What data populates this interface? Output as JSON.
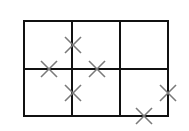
{
  "diagram": {
    "type": "grid-with-markers",
    "colors": {
      "background": "#ffffff",
      "grid": "#111111",
      "marker": "#7a7a7a"
    },
    "grid": {
      "rows": 2,
      "cols": 3,
      "x_lines": [
        24,
        72,
        120,
        168
      ],
      "y_lines": [
        21,
        69,
        116
      ],
      "stroke_width": 2
    },
    "markers": [
      {
        "shape": "x",
        "cx": 73,
        "cy": 45,
        "position": "on vertical line between row1 col1 and col2"
      },
      {
        "shape": "x",
        "cx": 49,
        "cy": 69,
        "position": "on horizontal line in col1"
      },
      {
        "shape": "x",
        "cx": 97,
        "cy": 69,
        "position": "on horizontal line in col2"
      },
      {
        "shape": "x",
        "cx": 73,
        "cy": 93,
        "position": "on vertical line between row2 col1 and col2"
      },
      {
        "shape": "x",
        "cx": 168,
        "cy": 93,
        "position": "on right edge in row2"
      },
      {
        "shape": "x",
        "cx": 144,
        "cy": 116,
        "position": "on bottom edge in col3"
      }
    ],
    "marker_size": 8
  }
}
